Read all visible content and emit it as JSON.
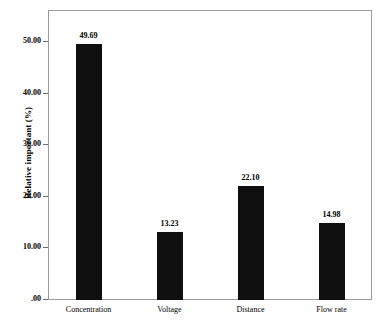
{
  "chart_data": {
    "type": "bar",
    "title": "",
    "xlabel": "",
    "ylabel": "Relative important (%)",
    "categories": [
      "Concentration",
      "Voltage",
      "Distance",
      "Flow rate"
    ],
    "values": [
      49.69,
      22.1,
      13.23,
      14.98
    ],
    "series": [
      {
        "name": "Relative important",
        "points": [
          {
            "category": "Concentration",
            "value": 49.69,
            "label": "49.69"
          },
          {
            "category": "Voltage",
            "value": 13.23,
            "label": "13.23"
          },
          {
            "category": "Distance",
            "value": 22.1,
            "label": "22.10"
          },
          {
            "category": "Flow rate",
            "value": 14.98,
            "label": "14.98"
          }
        ]
      }
    ],
    "ylim": [
      0,
      56.2
    ],
    "yticks": [
      0,
      10,
      20,
      30,
      40,
      50
    ],
    "ytick_labels": [
      ".00",
      "10.00",
      "20.00",
      "30.00",
      "40.00",
      "50.00"
    ],
    "grid": false,
    "legend": false,
    "bar_color": "#100f0f",
    "frame_color": "#9a9a9a",
    "background_color": "#ffffff"
  },
  "axis": {
    "y_title": "Relative important (%)",
    "y_ticks": [
      {
        "value": 50,
        "label": "50.00"
      },
      {
        "value": 40,
        "label": "40.00"
      },
      {
        "value": 30,
        "label": "30.00"
      },
      {
        "value": 20,
        "label": "20.00"
      },
      {
        "value": 10,
        "label": "10.00"
      },
      {
        "value": 0,
        "label": ".00"
      }
    ]
  },
  "bars": [
    {
      "category": "Concentration",
      "value": 49.69,
      "label": "49.69"
    },
    {
      "category": "Voltage",
      "value": 13.23,
      "label": "13.23"
    },
    {
      "category": "Distance",
      "value": 22.1,
      "label": "22.10"
    },
    {
      "category": "Flow rate",
      "value": 14.98,
      "label": "14.98"
    }
  ]
}
